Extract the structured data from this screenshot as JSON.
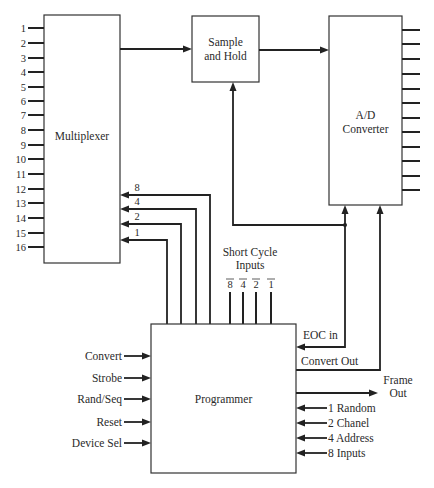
{
  "blocks": {
    "multiplexer": "Multiplexer",
    "sample_hold_line1": "Sample",
    "sample_hold_line2": "and Hold",
    "adc_line1": "A/D",
    "adc_line2": "Converter",
    "programmer": "Programmer"
  },
  "mux_inputs": [
    "1",
    "2",
    "3",
    "4",
    "5",
    "6",
    "7",
    "8",
    "9",
    "10",
    "11",
    "12",
    "13",
    "14",
    "15",
    "16"
  ],
  "address_lines": [
    "8",
    "4",
    "2",
    "1"
  ],
  "short_cycle": {
    "title_line1": "Short Cycle",
    "title_line2": "Inputs",
    "pins": [
      "8",
      "4",
      "2",
      "1"
    ]
  },
  "programmer_inputs": [
    "Convert",
    "Strobe",
    "Rand/Seq",
    "Reset",
    "Device Sel"
  ],
  "programmer_right": {
    "eoc": "EOC in",
    "convert_out": "Convert Out",
    "frame_out_line1": "Frame",
    "frame_out_line2": "Out",
    "mode_inputs": [
      "1 Random",
      "2 Chanel",
      "4 Address",
      "8 Inputs"
    ]
  },
  "adc_output_count": 12
}
